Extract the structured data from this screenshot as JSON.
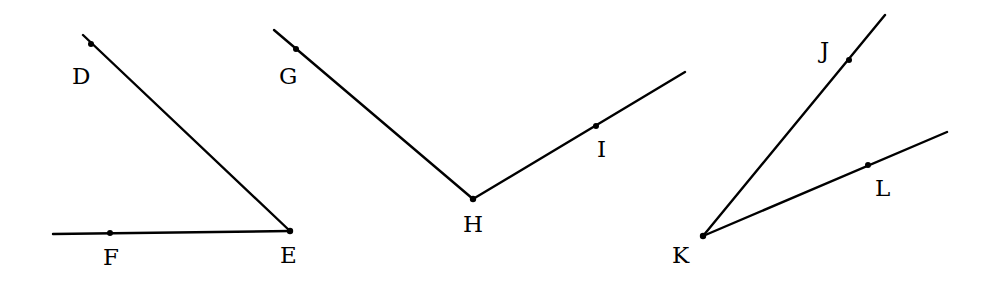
{
  "figure": {
    "colors": {
      "line": "#000000",
      "background": "#ffffff"
    },
    "angles": [
      {
        "name": "angle-DEF",
        "vertex": {
          "label": "E",
          "x": 290,
          "y": 231,
          "label_x": 280,
          "label_y": 263
        },
        "rays": [
          {
            "end": {
              "x": 83,
              "y": 35
            },
            "point": {
              "label": "D",
              "x": 91,
              "y": 44,
              "label_x": 72,
              "label_y": 84
            }
          },
          {
            "end": {
              "x": 53,
              "y": 234
            },
            "point": {
              "label": "F",
              "x": 110,
              "y": 233,
              "label_x": 103,
              "label_y": 265
            }
          }
        ]
      },
      {
        "name": "angle-GHI",
        "vertex": {
          "label": "H",
          "x": 473,
          "y": 199,
          "label_x": 463,
          "label_y": 232
        },
        "rays": [
          {
            "end": {
              "x": 274,
              "y": 30
            },
            "point": {
              "label": "G",
              "x": 296,
              "y": 49,
              "label_x": 279,
              "label_y": 84
            }
          },
          {
            "end": {
              "x": 685,
              "y": 72
            },
            "point": {
              "label": "I",
              "x": 596,
              "y": 126,
              "label_x": 597,
              "label_y": 157
            }
          }
        ]
      },
      {
        "name": "angle-JKL",
        "vertex": {
          "label": "K",
          "x": 703,
          "y": 236,
          "label_x": 672,
          "label_y": 263
        },
        "rays": [
          {
            "end": {
              "x": 885,
              "y": 15
            },
            "point": {
              "label": "J",
              "x": 849,
              "y": 60,
              "label_x": 820,
              "label_y": 58
            }
          },
          {
            "end": {
              "x": 947,
              "y": 132
            },
            "point": {
              "label": "L",
              "x": 868,
              "y": 165,
              "label_x": 875,
              "label_y": 196
            }
          }
        ]
      }
    ]
  }
}
